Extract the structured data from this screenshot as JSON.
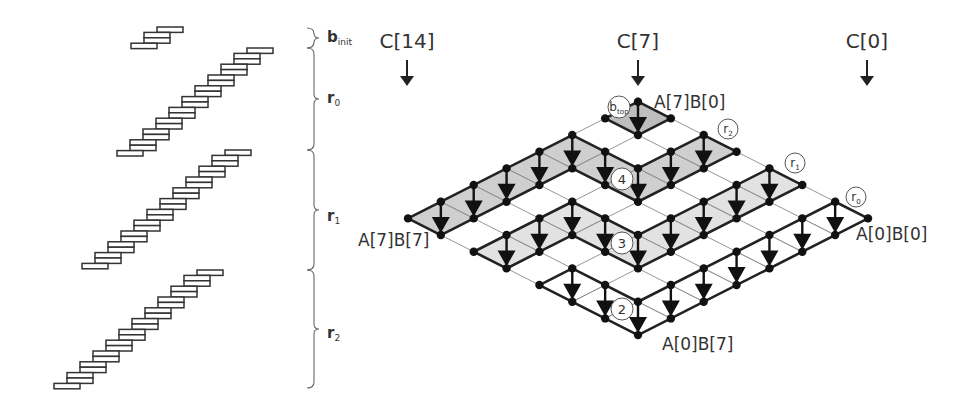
{
  "figure": {
    "left_panel": {
      "brace_labels": [
        {
          "id": "b_init",
          "main": "b",
          "sub": "init"
        },
        {
          "id": "r0",
          "main": "r",
          "sub": "0"
        },
        {
          "id": "r1",
          "main": "r",
          "sub": "1"
        },
        {
          "id": "r2",
          "main": "r",
          "sub": "2"
        }
      ],
      "staircases": [
        {
          "id": "b_init",
          "bars": 4
        },
        {
          "id": "r0",
          "bars": 20
        },
        {
          "id": "r1",
          "bars": 22
        },
        {
          "id": "r2",
          "bars": 22
        }
      ]
    },
    "right_panel": {
      "column_labels": [
        {
          "id": "c14",
          "text": "C[14]"
        },
        {
          "id": "c7",
          "text": "C[7]"
        },
        {
          "id": "c0",
          "text": "C[0]"
        }
      ],
      "corner_labels": [
        {
          "id": "top",
          "text": "A[7]B[0]"
        },
        {
          "id": "left",
          "text": "A[7]B[7]"
        },
        {
          "id": "right",
          "text": "A[0]B[0]"
        },
        {
          "id": "bottom",
          "text": "A[0]B[7]"
        }
      ],
      "grid_size": 7,
      "regions": [
        {
          "id": "b_top",
          "circle_main": "b",
          "circle_sub": "top",
          "fill": "#bdbdbd",
          "path": [
            [
              0,
              0
            ],
            [
              1,
              0
            ],
            [
              1,
              1
            ],
            [
              0,
              1
            ]
          ],
          "arrows": [
            [
              0,
              0
            ]
          ]
        },
        {
          "id": "r2",
          "circle_main": "4",
          "circle_sub": "",
          "fill": "#cfcfcf",
          "path": [
            [
              0,
              7
            ],
            [
              0,
              2
            ],
            [
              2,
              2
            ],
            [
              2,
              0
            ],
            [
              3,
              0
            ],
            [
              3,
              3
            ],
            [
              1,
              3
            ],
            [
              1,
              7
            ]
          ],
          "arrows": [
            [
              0,
              6
            ],
            [
              0,
              5
            ],
            [
              0,
              4
            ],
            [
              0,
              3
            ],
            [
              0,
              2
            ],
            [
              1,
              2
            ],
            [
              2,
              2
            ],
            [
              2,
              1
            ],
            [
              2,
              0
            ]
          ]
        },
        {
          "id": "r1",
          "circle_main": "3",
          "circle_sub": "",
          "fill": "#e2e2e2",
          "path": [
            [
              2,
              7
            ],
            [
              2,
              4
            ],
            [
              4,
              4
            ],
            [
              4,
              0
            ],
            [
              5,
              0
            ],
            [
              5,
              5
            ],
            [
              3,
              5
            ],
            [
              3,
              7
            ]
          ],
          "arrows": [
            [
              2,
              6
            ],
            [
              2,
              5
            ],
            [
              2,
              4
            ],
            [
              3,
              4
            ],
            [
              4,
              4
            ],
            [
              4,
              3
            ],
            [
              4,
              2
            ],
            [
              4,
              1
            ],
            [
              4,
              0
            ]
          ]
        },
        {
          "id": "r0",
          "circle_main": "2",
          "circle_sub": "",
          "fill": "#ffffff",
          "path": [
            [
              4,
              7
            ],
            [
              4,
              6
            ],
            [
              6,
              6
            ],
            [
              6,
              0
            ],
            [
              7,
              0
            ],
            [
              7,
              7
            ]
          ],
          "arrows": [
            [
              4,
              6
            ],
            [
              5,
              6
            ],
            [
              6,
              6
            ],
            [
              6,
              5
            ],
            [
              6,
              4
            ],
            [
              6,
              3
            ],
            [
              6,
              2
            ],
            [
              6,
              1
            ],
            [
              6,
              0
            ]
          ]
        }
      ],
      "round_labels": [
        {
          "id": "r2",
          "main": "r",
          "sub": "2"
        },
        {
          "id": "r1",
          "main": "r",
          "sub": "1"
        },
        {
          "id": "r0",
          "main": "r",
          "sub": "0"
        }
      ]
    }
  }
}
